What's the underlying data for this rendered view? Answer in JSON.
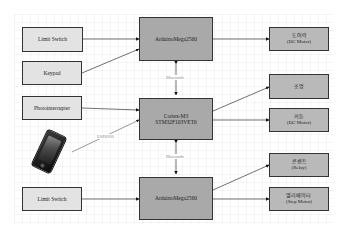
{
  "inputs": {
    "limit_switch_top": "Limit Switch",
    "keypad": "Keypad",
    "photointerrupter": "Photointerrupter",
    "limit_switch_bottom": "Limit Switch"
  },
  "controllers": {
    "arduino_top": "ArduinoMega2560",
    "cortex": "Cortex-M3\nSTM32F103VET6",
    "arduino_bottom": "ArduinoMega2560"
  },
  "outputs": {
    "door_lock": "도어락\n(DC Motor)",
    "lighting": "조명",
    "curtain": "커튼\n(DC Motor)",
    "outlet": "콘센트\n(Relay)",
    "elevator": "엘리베이터\n(Step Motor)"
  },
  "links": {
    "bluetooth_top": "Bluetooth",
    "bluetooth_bottom": "Bluetooth",
    "wifi": "ESP8266"
  },
  "icons": {
    "smartphone": "smartphone-icon"
  },
  "colors": {
    "input_fill": "#e3e3e3",
    "controller_fill": "#a9a9a9",
    "output_fill": "#b9b9b9",
    "border": "#333333"
  }
}
